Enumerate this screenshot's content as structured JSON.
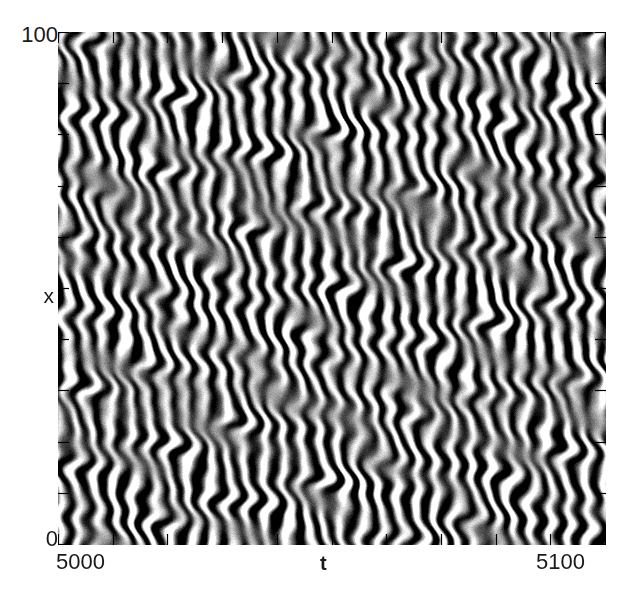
{
  "figure": {
    "kind": "spatiotemporal-density-plot",
    "background_color": "#ffffff",
    "ink_color": "#1a1a1a"
  },
  "axes": {
    "x": {
      "label": "t",
      "min_label": "5000",
      "max_label": "5100",
      "min": 5000,
      "max": 5100,
      "tick_count": 10,
      "ticks_inward": true
    },
    "y": {
      "label": "x",
      "min_label": "0",
      "max_label": "100",
      "min": 0,
      "max": 100,
      "tick_count": 10,
      "ticks_inward": true
    }
  },
  "chart_data": {
    "type": "heatmap",
    "title": "",
    "xlabel": "t",
    "ylabel": "x",
    "xlim": [
      5000,
      5100
    ],
    "ylim": [
      0,
      100
    ],
    "xtick_labels": [
      "5000",
      "5100"
    ],
    "ytick_labels": [
      "0",
      "100"
    ],
    "grid": false,
    "legend": "none",
    "colormap": "grayscale",
    "colormap_low": "#000000",
    "colormap_high": "#ffffff",
    "temporal_period": 3.45,
    "stripe_count_along_t": 29,
    "noise_amplitude": 0.09,
    "render": {
      "seed": 20240517,
      "base_level": 0.5,
      "modes": [
        {
          "kx": 0.0,
          "kt": 1.821,
          "amp": 1.0,
          "phase": 0.3,
          "tilt": 0.115,
          "note": "primary travelling wave"
        },
        {
          "kx": 0.0,
          "kt": 1.821,
          "amp": 0.22,
          "phase": 2.1,
          "tilt": -0.06,
          "note": "counter-propagating component"
        },
        {
          "kx": 0.0,
          "kt": 3.642,
          "amp": 0.13,
          "phase": 1.05,
          "tilt": 0.09,
          "note": "second harmonic"
        }
      ],
      "envelope_bands": [
        {
          "center": 100.0,
          "width": 13.0,
          "strength": 1.0
        },
        {
          "center": 86.0,
          "width": 10.0,
          "strength": 0.95
        },
        {
          "center": 74.0,
          "width": 8.0,
          "strength": 0.38
        },
        {
          "center": 62.0,
          "width": 10.0,
          "strength": 0.8
        },
        {
          "center": 50.0,
          "width": 9.0,
          "strength": 0.72
        },
        {
          "center": 38.0,
          "width": 9.0,
          "strength": 0.98
        },
        {
          "center": 27.0,
          "width": 9.0,
          "strength": 0.92
        },
        {
          "center": 16.0,
          "width": 8.0,
          "strength": 0.4
        },
        {
          "center": 7.0,
          "width": 8.0,
          "strength": 0.78
        },
        {
          "center": 0.0,
          "width": 7.0,
          "strength": 0.9
        }
      ],
      "phase_warp": [
        {
          "kx": 0.072,
          "kt": 0.055,
          "amp": 1.3,
          "phase": 0.4
        },
        {
          "kx": 0.131,
          "kt": 0.031,
          "amp": 0.85,
          "phase": 2.6
        },
        {
          "kx": 0.044,
          "kt": 0.088,
          "amp": 0.7,
          "phase": 4.1
        },
        {
          "kx": 0.205,
          "kt": 0.018,
          "amp": 0.45,
          "phase": 1.3
        }
      ],
      "amplitude_warp": [
        {
          "kx": 0.058,
          "kt": 0.041,
          "amp": 0.32,
          "phase": 1.9
        },
        {
          "kx": 0.113,
          "kt": 0.026,
          "amp": 0.24,
          "phase": 3.4
        },
        {
          "kx": 0.029,
          "kt": 0.072,
          "amp": 0.2,
          "phase": 0.7
        }
      ]
    }
  }
}
